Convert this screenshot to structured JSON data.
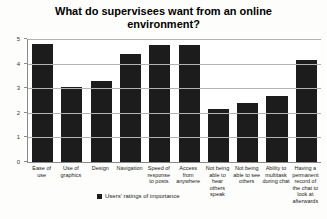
{
  "chart": {
    "title": "What do supervisees want from an online environment?",
    "legend_label": "Users' ratings of importance"
  },
  "chart_data": {
    "type": "bar",
    "title": "What do supervisees want from an online environment?",
    "categories": [
      "Ease of use",
      "Use of graphics",
      "Design",
      "Navigation",
      "Speed of response to posts",
      "Access from anywhere",
      "Not being able to hear others speak",
      "Not being able to see others",
      "Ability to multitask during chat",
      "Having a permanent record of the chat to look at afterwards"
    ],
    "values": [
      4.8,
      3.05,
      3.3,
      4.4,
      4.75,
      4.75,
      2.15,
      2.4,
      2.7,
      4.15
    ],
    "series_name": "Users' ratings of importance",
    "xlabel": "",
    "ylabel": "",
    "ylim": [
      0,
      5
    ],
    "yticks": [
      0,
      1,
      2,
      3,
      4,
      5
    ],
    "grid": true,
    "legend_position": "bottom",
    "bar_color": "#1c1c1c"
  }
}
